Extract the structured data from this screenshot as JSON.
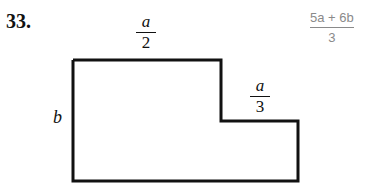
{
  "problem": {
    "number": "33.",
    "labels": {
      "top_width": {
        "numerator": "a",
        "denominator": "2"
      },
      "step_width": {
        "numerator": "a",
        "denominator": "3"
      },
      "height": "b"
    },
    "answer": {
      "numerator": "5a + 6b",
      "denominator": "3"
    }
  },
  "shape": {
    "type": "L-shaped polygon",
    "stroke_color": "#111111",
    "answer_color": "#8a8a8a"
  }
}
